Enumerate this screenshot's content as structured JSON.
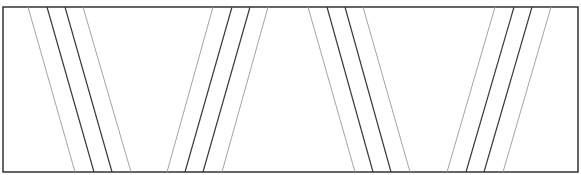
{
  "diagram": {
    "frame": {
      "x": 3,
      "y": 7,
      "width": 575,
      "height": 165,
      "stroke": "#333333"
    },
    "colors": {
      "outer": "#9a9a9a",
      "inner": "#3a3a3a"
    },
    "groups": [
      {
        "name": "group-1-slant-right",
        "lines": [
          {
            "top": 28,
            "bottom": 75,
            "kind": "outer"
          },
          {
            "top": 47,
            "bottom": 94,
            "kind": "inner"
          },
          {
            "top": 65,
            "bottom": 112,
            "kind": "inner"
          },
          {
            "top": 83,
            "bottom": 131,
            "kind": "outer"
          }
        ]
      },
      {
        "name": "group-2-slant-left",
        "lines": [
          {
            "top": 213,
            "bottom": 167,
            "kind": "outer"
          },
          {
            "top": 232,
            "bottom": 185,
            "kind": "inner"
          },
          {
            "top": 250,
            "bottom": 203,
            "kind": "inner"
          },
          {
            "top": 268,
            "bottom": 222,
            "kind": "outer"
          }
        ]
      },
      {
        "name": "group-3-slant-right",
        "lines": [
          {
            "top": 308,
            "bottom": 355,
            "kind": "outer"
          },
          {
            "top": 327,
            "bottom": 373,
            "kind": "inner"
          },
          {
            "top": 345,
            "bottom": 391,
            "kind": "inner"
          },
          {
            "top": 363,
            "bottom": 410,
            "kind": "outer"
          }
        ]
      },
      {
        "name": "group-4-slant-left",
        "lines": [
          {
            "top": 495,
            "bottom": 447,
            "kind": "outer"
          },
          {
            "top": 514,
            "bottom": 466,
            "kind": "inner"
          },
          {
            "top": 532,
            "bottom": 484,
            "kind": "inner"
          },
          {
            "top": 551,
            "bottom": 503,
            "kind": "outer"
          }
        ]
      }
    ]
  }
}
